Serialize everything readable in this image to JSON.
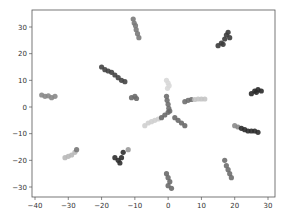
{
  "chart_data": {
    "type": "scatter",
    "title": "",
    "xlabel": "",
    "ylabel": "",
    "xlim": [
      -41,
      32
    ],
    "ylim": [
      -35,
      37
    ],
    "grid": false,
    "legend": null,
    "x_ticks": [
      -40,
      -30,
      -20,
      -10,
      0,
      10,
      20,
      30
    ],
    "y_ticks": [
      -30,
      -20,
      -10,
      0,
      10,
      20,
      30
    ],
    "x_tick_labels": [
      "−40",
      "−30",
      "−20",
      "−10",
      "0",
      "10",
      "20",
      "30"
    ],
    "y_tick_labels": [
      "−30",
      "−20",
      "−10",
      "0",
      "10",
      "20",
      "30"
    ],
    "series": [
      {
        "name": "cluster-1",
        "color": "#7a7a7a",
        "points": [
          [
            -10.5,
            33
          ],
          [
            -10.2,
            31.5
          ],
          [
            -9.8,
            30.5
          ],
          [
            -9.6,
            29
          ],
          [
            -9.2,
            27.5
          ],
          [
            -8.8,
            26
          ]
        ]
      },
      {
        "name": "cluster-2",
        "color": "#3c3c3c",
        "points": [
          [
            15,
            23
          ],
          [
            16,
            24
          ],
          [
            17,
            25.5
          ],
          [
            17.5,
            27
          ],
          [
            18,
            28
          ],
          [
            18.5,
            26
          ],
          [
            16.5,
            23.5
          ]
        ]
      },
      {
        "name": "cluster-3",
        "color": "#444444",
        "points": [
          [
            -20,
            15
          ],
          [
            -19,
            14
          ],
          [
            -18,
            13.5
          ],
          [
            -17,
            13
          ],
          [
            -16,
            12
          ],
          [
            -15,
            11
          ],
          [
            -14,
            10
          ],
          [
            -13,
            9.5
          ]
        ]
      },
      {
        "name": "cluster-4",
        "color": "#888888",
        "points": [
          [
            -38,
            4.5
          ],
          [
            -37,
            4
          ],
          [
            -36,
            4.2
          ],
          [
            -35,
            3.5
          ],
          [
            -34,
            4
          ]
        ]
      },
      {
        "name": "cluster-5",
        "color": "#6a6a6a",
        "points": [
          [
            -11,
            3.5
          ],
          [
            -10,
            4
          ],
          [
            -9.5,
            3.2
          ]
        ]
      },
      {
        "name": "cluster-6",
        "color": "#d8d8d8",
        "points": [
          [
            -0.5,
            10
          ],
          [
            0,
            9
          ],
          [
            0.3,
            8
          ],
          [
            -0.2,
            7
          ]
        ]
      },
      {
        "name": "cluster-7",
        "color": "#6e6e6e",
        "points": [
          [
            -0.5,
            4
          ],
          [
            -0.3,
            2.5
          ],
          [
            0,
            1
          ],
          [
            0.2,
            -0.5
          ],
          [
            0.5,
            -1.5
          ]
        ]
      },
      {
        "name": "cluster-8",
        "color": "#707070",
        "points": [
          [
            5,
            2
          ],
          [
            6,
            2.5
          ],
          [
            7,
            2.8
          ]
        ]
      },
      {
        "name": "cluster-8b",
        "color": "#c4c4c4",
        "points": [
          [
            8,
            2.8
          ],
          [
            9,
            3
          ],
          [
            10,
            3
          ],
          [
            11,
            3
          ]
        ]
      },
      {
        "name": "cluster-9",
        "color": "#cfcfcf",
        "points": [
          [
            -7,
            -7
          ],
          [
            -6,
            -6
          ],
          [
            -5,
            -5.5
          ],
          [
            -4,
            -5
          ],
          [
            -3,
            -4.5
          ]
        ]
      },
      {
        "name": "cluster-9b",
        "color": "#6a6a6a",
        "points": [
          [
            -2,
            -4
          ],
          [
            -1,
            -3
          ],
          [
            0,
            -2
          ]
        ]
      },
      {
        "name": "cluster-10",
        "color": "#696969",
        "points": [
          [
            2,
            -4
          ],
          [
            3,
            -5
          ],
          [
            4,
            -6
          ],
          [
            5,
            -7
          ]
        ]
      },
      {
        "name": "cluster-11",
        "color": "#2a2a2a",
        "points": [
          [
            25,
            5
          ],
          [
            26,
            6
          ],
          [
            27,
            6.5
          ],
          [
            28,
            6
          ],
          [
            26.5,
            5.5
          ]
        ]
      },
      {
        "name": "cluster-12",
        "color": "#8a8a8a",
        "points": [
          [
            20,
            -7
          ],
          [
            21,
            -7.5
          ]
        ]
      },
      {
        "name": "cluster-12b",
        "color": "#2e2e2e",
        "points": [
          [
            22,
            -8
          ],
          [
            23,
            -8.5
          ],
          [
            24,
            -9
          ],
          [
            25,
            -9
          ],
          [
            26,
            -9
          ],
          [
            27,
            -9.5
          ]
        ]
      },
      {
        "name": "cluster-13",
        "color": "#b8b8b8",
        "points": [
          [
            -31,
            -19
          ],
          [
            -30,
            -18.5
          ],
          [
            -29,
            -18
          ],
          [
            -28,
            -17
          ]
        ]
      },
      {
        "name": "cluster-13b",
        "color": "#777777",
        "points": [
          [
            -27.5,
            -16
          ]
        ]
      },
      {
        "name": "cluster-14",
        "color": "#2f2f2f",
        "points": [
          [
            -16,
            -19
          ],
          [
            -15,
            -20
          ],
          [
            -14,
            -19
          ],
          [
            -13.5,
            -17
          ],
          [
            -14.5,
            -21
          ]
        ]
      },
      {
        "name": "cluster-14b",
        "color": "#9a9a9a",
        "points": [
          [
            -12,
            -16
          ]
        ]
      },
      {
        "name": "cluster-15",
        "color": "#6a6a6a",
        "points": [
          [
            -0.5,
            -25
          ],
          [
            0,
            -26.5
          ],
          [
            0.5,
            -28
          ],
          [
            0,
            -29.5
          ],
          [
            1,
            -30.5
          ]
        ]
      },
      {
        "name": "cluster-16",
        "color": "#6e6e6e",
        "points": [
          [
            17,
            -20
          ],
          [
            17.5,
            -22
          ],
          [
            18,
            -23.5
          ],
          [
            18.5,
            -25
          ],
          [
            19,
            -26.5
          ]
        ]
      }
    ]
  }
}
